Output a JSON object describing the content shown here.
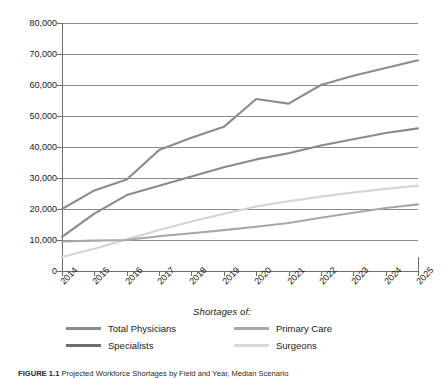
{
  "chart_data": {
    "type": "line",
    "title": "",
    "xlabel": "",
    "ylabel": "",
    "x": [
      "2014",
      "2015",
      "2016",
      "2017",
      "2018",
      "2019",
      "2020",
      "2021",
      "2022",
      "2023",
      "2024",
      "2025"
    ],
    "categories": [
      "2014",
      "2015",
      "2016",
      "2017",
      "2018",
      "2019",
      "2020",
      "2021",
      "2022",
      "2023",
      "2024",
      "2025"
    ],
    "ylim": [
      0,
      80000
    ],
    "ytick_values": [
      0,
      10000,
      20000,
      30000,
      40000,
      50000,
      60000,
      70000,
      80000
    ],
    "ytick_labels": [
      "0",
      "10,000",
      "20,000",
      "30,000",
      "40,000",
      "50,000",
      "60,000",
      "70,000",
      "80,000"
    ],
    "grid": true,
    "legend_position": "bottom",
    "legend_title": "Shortages of:",
    "series": [
      {
        "name": "Total Physicians",
        "color": "#8c8c8c",
        "values": [
          20000,
          26000,
          29500,
          39000,
          43000,
          46500,
          55500,
          54000,
          60000,
          63000,
          65500,
          68000
        ]
      },
      {
        "name": "Specialists",
        "color": "#8a8a8a",
        "values": [
          11000,
          18500,
          24500,
          27500,
          30500,
          33500,
          36000,
          38000,
          40500,
          42500,
          44500,
          46000
        ]
      },
      {
        "name": "Primary Care",
        "color": "#a8a8a8",
        "values": [
          9500,
          9800,
          10000,
          11200,
          12200,
          13200,
          14300,
          15500,
          17200,
          18800,
          20300,
          21500
        ]
      },
      {
        "name": "Surgeons",
        "color": "#d4d4d4",
        "values": [
          4500,
          7200,
          10200,
          13200,
          16000,
          18500,
          20800,
          22500,
          24000,
          25300,
          26500,
          27500
        ]
      }
    ]
  },
  "legend": {
    "title": "Shortages of:",
    "entries": [
      {
        "label": "Total Physicians",
        "color": "#8c8c8c"
      },
      {
        "label": "Specialists",
        "color": "#6e6e6e"
      },
      {
        "label": "Primary Care",
        "color": "#a8a8a8"
      },
      {
        "label": "Surgeons",
        "color": "#d8d8d8"
      }
    ]
  },
  "caption": {
    "figure_label": "FIGURE 1.1",
    "text": "Projected Workforce Shortages by Field and Year, Median Scenario"
  },
  "colors": {
    "axis": "#6e6e6e",
    "grid": "#8a8a8a",
    "text": "#1a1a1a",
    "background": "#ffffff"
  }
}
